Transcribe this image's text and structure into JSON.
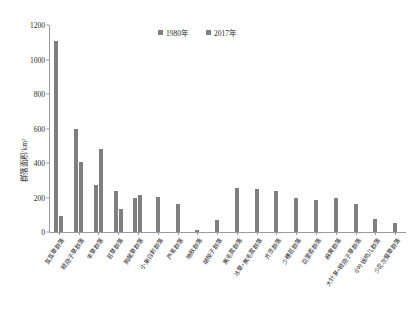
{
  "chart_data": {
    "type": "bar",
    "title": "",
    "xlabel": "",
    "ylabel": "群落面积/km²",
    "ylim": [
      0,
      1200
    ],
    "yticks": [
      0,
      200,
      400,
      600,
      800,
      1000,
      1200
    ],
    "grid": false,
    "legend_position": "top-center",
    "categories": [
      "芨芨草群落",
      "糙隐子草群落",
      "羊草群落",
      "苔草群落",
      "狗尾草群落",
      "小果白刺群落",
      "芦苇群落",
      "地肤群落",
      "胡枝子群落",
      "黑毛蒿群落",
      "冰草+黑毛蒿群落",
      "齐茨群落",
      "少穗苔群落",
      "百里香群落",
      "麻黄群落",
      "大针茅+糙隐子草群落",
      "小叶锦鸡儿群落",
      "少花次藜草群落"
    ],
    "series": [
      {
        "name": "1980年",
        "color": "#7f7f7f",
        "values": [
          1110,
          600,
          270,
          240,
          200,
          0,
          0,
          0,
          0,
          0,
          0,
          0,
          0,
          0,
          0,
          0,
          0,
          0
        ]
      },
      {
        "name": "2017年",
        "color": "#7f7f7f",
        "values": [
          95,
          405,
          480,
          135,
          215,
          205,
          165,
          10,
          70,
          255,
          250,
          235,
          195,
          185,
          200,
          160,
          75,
          50
        ]
      }
    ]
  },
  "legend": {
    "items": [
      {
        "label": "1980年",
        "color": "#7f7f7f"
      },
      {
        "label": "2017年",
        "color": "#7f7f7f"
      }
    ]
  },
  "axis": {
    "y_title": "群落面积/km²",
    "y_tick_labels": [
      "0",
      "200",
      "400",
      "600",
      "800",
      "1000",
      "1200"
    ]
  }
}
